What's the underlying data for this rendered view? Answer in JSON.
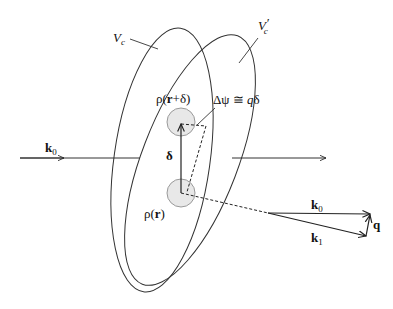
{
  "diagram": {
    "title": "",
    "labels": {
      "vc": "V",
      "vc_sub": "c",
      "vc_prime": "V",
      "vc_prime_sub": "c",
      "vc_prime_mark": "′",
      "rho_r_plus_delta": {
        "rho": "ρ(",
        "r": "r",
        "plus_delta": "+δ)"
      },
      "delta_psi": {
        "text": "Δψ ≅ ",
        "q": "q",
        "delta": "δ"
      },
      "delta": "δ",
      "rho_r": {
        "rho": "ρ(",
        "r": "r",
        "close": ")"
      },
      "k0_incident": {
        "k": "k",
        "sub": "0"
      },
      "k0_vector": {
        "k": "k",
        "sub": "0"
      },
      "k1_vector": {
        "k": "k",
        "sub": "1"
      },
      "q_vector": "q"
    },
    "nodes": [
      {
        "id": "scattering-volume-vc",
        "label": "V_c",
        "shape": "ellipse"
      },
      {
        "id": "scattering-volume-vc-prime",
        "label": "V_c'",
        "shape": "ellipse"
      },
      {
        "id": "density-at-r-plus-delta",
        "label": "ρ(r+δ)",
        "shape": "circle"
      },
      {
        "id": "density-at-r",
        "label": "ρ(r)",
        "shape": "circle"
      }
    ],
    "edges": [
      {
        "from": "left",
        "to": "right",
        "label": "k0",
        "style": "solid-arrow"
      },
      {
        "from": "density-at-r",
        "to": "density-at-r-plus-delta",
        "label": "δ",
        "style": "solid-arrow"
      },
      {
        "from": "density-at-r-plus-delta",
        "to": "path-difference",
        "label": "Δψ ≅ qδ",
        "style": "dashed"
      },
      {
        "from": "density-at-r",
        "to": "scattered-direction",
        "label": "",
        "style": "dashed"
      },
      {
        "from": "origin",
        "to": "k0-tip",
        "label": "k0",
        "style": "solid-arrow"
      },
      {
        "from": "origin",
        "to": "k1-tip",
        "label": "k1",
        "style": "solid-arrow"
      },
      {
        "from": "k1-tip",
        "to": "k0-tip",
        "label": "q",
        "style": "solid-arrow"
      }
    ],
    "colors": {
      "stroke": "#222222",
      "circle_fill": "#e6e6e6",
      "circle_stroke": "#9a9a9a"
    }
  }
}
